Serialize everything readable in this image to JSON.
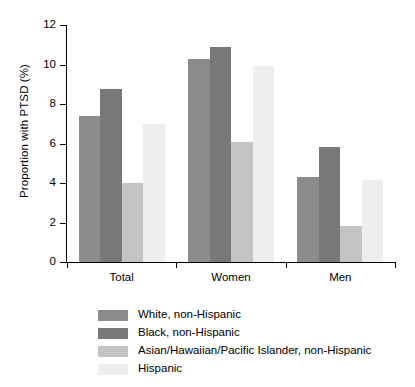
{
  "chart_data": {
    "type": "bar",
    "title": "",
    "xlabel": "",
    "ylabel": "Proportion with PTSD (%)",
    "categories": [
      "Total",
      "Women",
      "Men"
    ],
    "ylim": [
      0,
      12
    ],
    "yticks": [
      0,
      2,
      4,
      6,
      8,
      10,
      12
    ],
    "ytick_labels": [
      "0",
      "2",
      "4",
      "6",
      "8",
      "10",
      "12"
    ],
    "grid": false,
    "legend_position": "bottom-left",
    "series": [
      {
        "name": "White, non-Hispanic",
        "color": "#8c8c8c",
        "values": [
          7.4,
          10.3,
          4.3
        ]
      },
      {
        "name": "Black, non-Hispanic",
        "color": "#787878",
        "values": [
          8.75,
          10.9,
          5.8
        ]
      },
      {
        "name": "Asian/Hawaiian/Pacific Islander, non-Hispanic",
        "color": "#c4c4c4",
        "values": [
          4.0,
          6.1,
          1.8
        ]
      },
      {
        "name": "Hispanic",
        "color": "#eeeeee",
        "values": [
          7.0,
          9.9,
          4.15
        ]
      }
    ]
  },
  "axis": {
    "y_title": "Proportion with PTSD (%)"
  }
}
